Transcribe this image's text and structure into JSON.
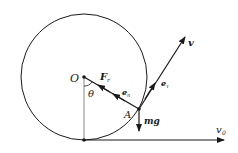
{
  "diagram": {
    "type": "physics-free-body",
    "labels": {
      "center": "O",
      "angle": "θ",
      "point": "A",
      "force_normal": "F",
      "force_normal_sub": "r",
      "unit_normal": "e",
      "unit_normal_sub": "n",
      "unit_tangent": "e",
      "unit_tangent_sub": "τ",
      "velocity": "v",
      "gravity": "mg",
      "initial_velocity": "v",
      "initial_velocity_sub": "0"
    },
    "colors": {
      "stroke": "#1a1a1a",
      "radius_line": "#888888",
      "background": "#ffffff"
    }
  }
}
